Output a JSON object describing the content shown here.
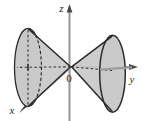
{
  "figure": {
    "background_color": "#ffffff",
    "axes": {
      "z": {
        "label": "z",
        "orientation": "vertical-up",
        "color": "#8c8c8c",
        "arrow": "up"
      },
      "y": {
        "label": "y",
        "orientation": "horizontal-right",
        "color": "#8c8c8c",
        "arrow": "right"
      },
      "x": {
        "label": "x",
        "orientation": "oblique-down-left",
        "color": "#8c8c8c",
        "arrow": "down-left"
      }
    },
    "origin": {
      "label": "0"
    },
    "surfaces": {
      "left_nappe": {
        "name": "left-cone-nappe",
        "fill_color": "#c9c9c9",
        "stroke_color": "#2b2b2b",
        "base_edge": "solid-ellipse",
        "hidden_edge": "dashed-ellipse"
      },
      "right_nappe": {
        "name": "right-cone-nappe",
        "fill_color": "#c9c9c9",
        "stroke_color": "#2b2b2b",
        "base_edge": "solid-ellipse"
      }
    },
    "guides": {
      "dashed_axis_color": "#3a3a3a",
      "dashed_pattern": "2 2"
    }
  }
}
